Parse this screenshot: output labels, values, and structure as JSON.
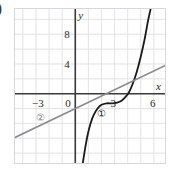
{
  "figure": {
    "leading_paren": ")",
    "background": "#ffffff",
    "frame_color": "#d8d8dc",
    "grid_color": "#e2e2e8",
    "axis_color": "#3a3a3a"
  },
  "chart_data": {
    "type": "line",
    "title": "",
    "subtitle": "",
    "xlabel": "x",
    "ylabel": "y",
    "xlim": [
      -4.6,
      7.0
    ],
    "ylim": [
      -9.6,
      11.4
    ],
    "grid": true,
    "grid_spacing_x": 1,
    "grid_spacing_y": 2,
    "legend": "inline-annotations",
    "legend_position": "inside-plot",
    "xticks": [
      -3,
      0,
      3,
      6
    ],
    "xtick_labels": [
      "−3",
      "0",
      "3",
      "6"
    ],
    "yticks": [
      4,
      8
    ],
    "ytick_labels": [
      "4",
      "8"
    ],
    "annotations": [
      {
        "text": "①",
        "x": 2.05,
        "y": -2.8,
        "color": "#2a2a2a",
        "refers_to": "cubic-curve"
      },
      {
        "text": "②",
        "x": -2.6,
        "y": -3.3,
        "color": "#8a8a8f",
        "refers_to": "straight-line"
      }
    ],
    "series": [
      {
        "name": "① cubic curve",
        "label": "①",
        "type": "cubic",
        "color": "#1a1a1a",
        "stroke_width": 1.8,
        "description": "S-shaped cubic with a flat inflection near x=2, crossing the x-axis near x=4.1 and rising steeply",
        "inflection": {
          "x": 2.0,
          "y": -1.0
        },
        "x_intercept": 4.1,
        "points": [
          {
            "x": 0.55,
            "y": -9.6
          },
          {
            "x": 0.75,
            "y": -7.4
          },
          {
            "x": 0.95,
            "y": -5.5
          },
          {
            "x": 1.15,
            "y": -4.1
          },
          {
            "x": 1.4,
            "y": -2.9
          },
          {
            "x": 1.7,
            "y": -2.0
          },
          {
            "x": 2.0,
            "y": -1.5
          },
          {
            "x": 2.4,
            "y": -1.3
          },
          {
            "x": 2.8,
            "y": -1.3
          },
          {
            "x": 3.2,
            "y": -1.2
          },
          {
            "x": 3.5,
            "y": -1.0
          },
          {
            "x": 3.8,
            "y": -0.5
          },
          {
            "x": 4.1,
            "y": 0.2
          },
          {
            "x": 4.4,
            "y": 1.4
          },
          {
            "x": 4.7,
            "y": 3.0
          },
          {
            "x": 5.0,
            "y": 5.0
          },
          {
            "x": 5.3,
            "y": 7.4
          },
          {
            "x": 5.55,
            "y": 9.8
          },
          {
            "x": 5.75,
            "y": 11.4
          }
        ]
      },
      {
        "name": "② straight line",
        "label": "②",
        "type": "line",
        "color": "#8a8a8f",
        "stroke_width": 1.6,
        "description": "Straight line of positive slope passing below the origin",
        "slope": 0.84,
        "y_intercept": -2.0,
        "points": [
          {
            "x": -4.6,
            "y": -5.9
          },
          {
            "x": 7.0,
            "y": 3.9
          }
        ]
      }
    ],
    "intersections": [
      {
        "x": 5.15,
        "y": 2.3,
        "between": [
          "①",
          "②"
        ]
      }
    ]
  }
}
